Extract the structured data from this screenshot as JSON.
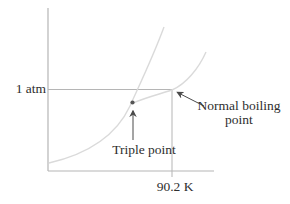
{
  "figure": {
    "kind": "phase-diagram-sketch",
    "labels": {
      "pressure_ref": "1 atm",
      "temperature_ref": "90.2 K",
      "triple_point": "Triple point",
      "normal_boiling_point": "Normal boiling point"
    },
    "key_points": [
      {
        "name": "triple-point",
        "label": "Triple point",
        "marker": "dot"
      },
      {
        "name": "normal-boiling-point",
        "label": "Normal boiling point",
        "pressure": "1 atm",
        "temperature": "90.2 K"
      }
    ],
    "curves": [
      {
        "name": "fusion-sublimation-curve"
      },
      {
        "name": "vaporization-curve"
      }
    ],
    "colors": {
      "background": "#ffffff",
      "axis_line": "#b5b5b5",
      "reference_line": "#b5b5b5",
      "curve_line": "#dadada",
      "annotation": "#4a4a4a",
      "text": "#2e2e2e"
    }
  }
}
